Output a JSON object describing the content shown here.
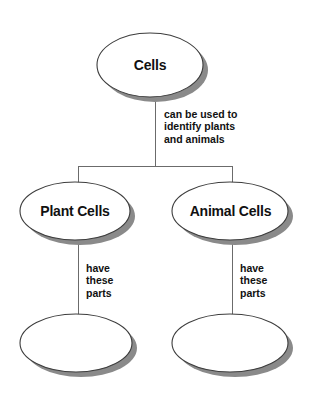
{
  "diagram": {
    "type": "concept-map",
    "colors": {
      "background": "#ffffff",
      "node_fill": "#ffffff",
      "node_stroke": "#3d3d3d",
      "node_shadow": "#8a8a8a",
      "connector": "#6b6b6b",
      "text": "#111111"
    },
    "nodes": [
      {
        "id": "root",
        "label": "Cells",
        "shape": "ellipse",
        "filled": false,
        "level": 0,
        "cx": 150,
        "cy": 65,
        "rx": 53,
        "ry": 32
      },
      {
        "id": "plant-cells",
        "label": "Plant Cells",
        "shape": "ellipse",
        "filled": false,
        "level": 1,
        "cx": 75,
        "cy": 211,
        "rx": 55,
        "ry": 29
      },
      {
        "id": "animal-cells",
        "label": "Animal Cells",
        "shape": "ellipse",
        "filled": false,
        "level": 1,
        "cx": 230,
        "cy": 211,
        "rx": 58,
        "ry": 29
      },
      {
        "id": "plant-parts",
        "label": "",
        "shape": "ellipse",
        "filled": false,
        "level": 2,
        "cx": 76,
        "cy": 343,
        "rx": 56,
        "ry": 29
      },
      {
        "id": "animal-parts",
        "label": "",
        "shape": "ellipse",
        "filled": false,
        "level": 2,
        "cx": 230,
        "cy": 343,
        "rx": 58,
        "ry": 29
      }
    ],
    "edges": [
      {
        "id": "root-to-children",
        "from": "root",
        "to": [
          "plant-cells",
          "animal-cells"
        ],
        "label_lines": [
          "can be used to",
          "identify plants",
          "and animals"
        ]
      },
      {
        "id": "plant-to-parts",
        "from": "plant-cells",
        "to": [
          "plant-parts"
        ],
        "label_lines": [
          "have",
          "these",
          "parts"
        ]
      },
      {
        "id": "animal-to-parts",
        "from": "animal-cells",
        "to": [
          "animal-parts"
        ],
        "label_lines": [
          "have",
          "these",
          "parts"
        ]
      }
    ]
  }
}
